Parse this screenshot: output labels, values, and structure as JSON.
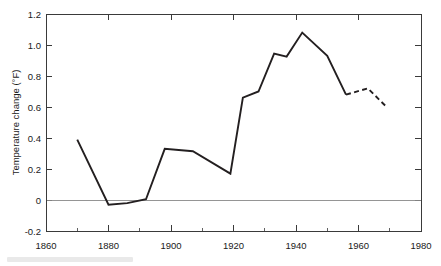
{
  "chart_data": {
    "type": "line",
    "title": "",
    "subtitle": "",
    "xlabel": "",
    "ylabel": "Temperature change (°F)",
    "xlim": [
      1860,
      1980
    ],
    "ylim": [
      -0.2,
      1.2
    ],
    "grid": false,
    "legend": "none",
    "x_ticks": [
      1860,
      1880,
      1900,
      1920,
      1940,
      1960,
      1980
    ],
    "x_tick_labels": [
      "1860",
      "1880",
      "1900",
      "1920",
      "1940",
      "1960",
      "1980"
    ],
    "x_minor_ticks": [
      1870,
      1890,
      1910,
      1930,
      1950,
      1970
    ],
    "y_ticks": [
      -0.2,
      0,
      0.2,
      0.4,
      0.6,
      0.8,
      1.0,
      1.2
    ],
    "y_tick_labels": [
      "-0.2",
      "0",
      "0.2",
      "0.4",
      "0.6",
      "0.8",
      "1.0",
      "1.2"
    ],
    "reference_lines": [
      {
        "axis": "y",
        "value": 0,
        "style": "solid",
        "color": "#8a8a8a"
      }
    ],
    "series": [
      {
        "name": "Temperature change (observed)",
        "style": "solid",
        "color": "#231f20",
        "x": [
          1870,
          1880,
          1886,
          1892,
          1898,
          1907,
          1919,
          1923,
          1928,
          1933,
          1937,
          1942,
          1950,
          1956
        ],
        "values": [
          0.39,
          -0.03,
          -0.02,
          0.005,
          0.33,
          0.315,
          0.17,
          0.66,
          0.7,
          0.945,
          0.925,
          1.08,
          0.93,
          0.68
        ]
      },
      {
        "name": "Temperature change (projected)",
        "style": "dashed",
        "color": "#231f20",
        "x": [
          1956,
          1963,
          1969
        ],
        "values": [
          0.68,
          0.72,
          0.6
        ]
      }
    ]
  },
  "axes": {
    "y_axis_title": "Temperature change (°F)"
  }
}
